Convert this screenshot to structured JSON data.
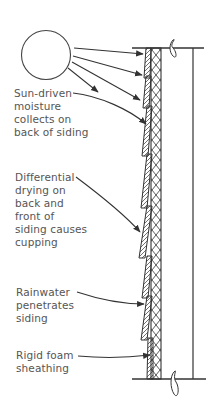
{
  "diagram": {
    "elements": {
      "sun": "sun-icon",
      "sheathing": "rigid-foam-sheathing",
      "siding": "lap-siding-boards",
      "stud": "wall-stud",
      "break_marks": "break-line-icon"
    },
    "labels": [
      {
        "id": "sun-driven",
        "text": "Sun-driven\nmoisture\ncollects on\nback of siding"
      },
      {
        "id": "differential",
        "text": "Differential\ndrying on\nback and\nfront of\nsiding causes\ncupping"
      },
      {
        "id": "rainwater",
        "text": "Rainwater\npenetrates\nsiding"
      },
      {
        "id": "foam",
        "text": "Rigid foam\nsheathing"
      }
    ],
    "colors": {
      "line": "#333333",
      "text": "#555555",
      "background": "#ffffff"
    }
  }
}
